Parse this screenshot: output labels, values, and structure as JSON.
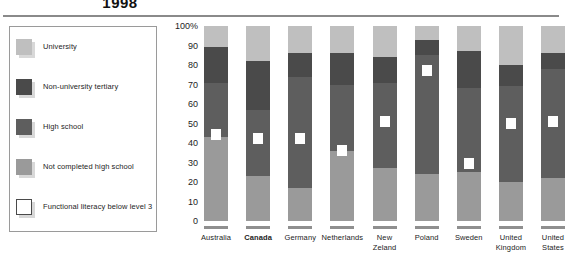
{
  "title": "1998",
  "legend": {
    "items": [
      {
        "label": "University",
        "color": "#bfbfbf",
        "type": "fill"
      },
      {
        "label": "Non-university tertiary",
        "color": "#4a4a4a",
        "type": "fill"
      },
      {
        "label": "High school",
        "color": "#5e5e5e",
        "type": "fill"
      },
      {
        "label": "Not completed high school",
        "color": "#9a9a9a",
        "type": "fill"
      },
      {
        "label": "Functional literacy below level 3",
        "color": "#ffffff",
        "type": "outline"
      }
    ]
  },
  "chart_data": {
    "type": "bar",
    "title": "1998",
    "xlabel": "",
    "ylabel": "",
    "ylim": [
      0,
      100
    ],
    "ytick_labels": [
      "100%",
      "90",
      "80",
      "70",
      "60",
      "50",
      "40",
      "30",
      "20",
      "10",
      "0"
    ],
    "ytick_values": [
      100,
      90,
      80,
      70,
      60,
      50,
      40,
      30,
      20,
      10,
      0
    ],
    "grid": false,
    "legend_position": "left",
    "stacked": true,
    "stack_order_bottom_to_top": [
      "Not completed high school",
      "High school",
      "Non-university tertiary",
      "University"
    ],
    "categories": [
      "Australia",
      "Canada",
      "Germany",
      "Netherlands",
      "New Zeland",
      "Poland",
      "Sweden",
      "United Kingdom",
      "United States"
    ],
    "highlight_category": "Canada",
    "series": [
      {
        "name": "Not completed high school",
        "color": "#9a9a9a",
        "values": [
          43,
          23,
          17,
          36,
          27,
          24,
          25,
          20,
          22
        ]
      },
      {
        "name": "High school",
        "color": "#5e5e5e",
        "values": [
          28,
          34,
          57,
          34,
          44,
          61,
          43,
          49,
          56
        ]
      },
      {
        "name": "Non-university tertiary",
        "color": "#4a4a4a",
        "values": [
          18,
          25,
          12,
          16,
          13,
          8,
          19,
          11,
          8
        ]
      },
      {
        "name": "University",
        "color": "#bfbfbf",
        "values": [
          11,
          18,
          14,
          14,
          16,
          7,
          13,
          20,
          14
        ]
      }
    ],
    "marker_series": {
      "name": "Functional literacy below level 3",
      "color": "#ffffff",
      "values": [
        44,
        42,
        42,
        36,
        51,
        77,
        29,
        50,
        51
      ]
    }
  }
}
